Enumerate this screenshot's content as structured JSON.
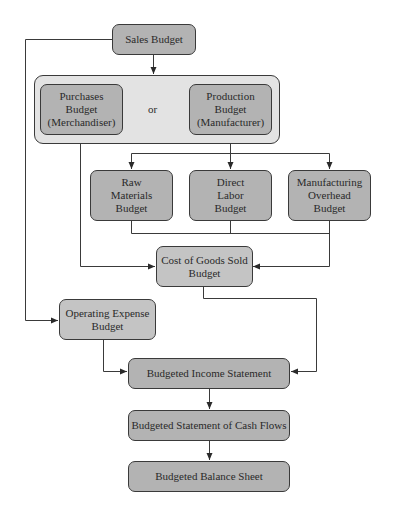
{
  "diagram": {
    "colors": {
      "group_fill": "#e3e3e3",
      "box_dark": "#b3b3b3",
      "box_mid": "#c4c4c4",
      "line": "#3a3a3a"
    },
    "nodes": {
      "sales": "Sales Budget",
      "purchases": "Purchases\nBudget\n(Merchandiser)",
      "or": "or",
      "production": "Production\nBudget\n(Manufacturer)",
      "raw_materials": "Raw\nMaterials\nBudget",
      "direct_labor": "Direct\nLabor\nBudget",
      "overhead": "Manufacturing\nOverhead\nBudget",
      "cogs": "Cost of Goods Sold\nBudget",
      "operating_expense": "Operating Expense\nBudget",
      "income_statement": "Budgeted Income Statement",
      "cash_flows": "Budgeted Statement of Cash Flows",
      "balance_sheet": "Budgeted Balance Sheet"
    },
    "edges": [
      [
        "sales",
        "purchases_or_production"
      ],
      [
        "sales",
        "operating_expense"
      ],
      [
        "production",
        "raw_materials"
      ],
      [
        "production",
        "direct_labor"
      ],
      [
        "production",
        "overhead"
      ],
      [
        "purchases",
        "cogs"
      ],
      [
        "raw_materials",
        "cogs"
      ],
      [
        "direct_labor",
        "cogs"
      ],
      [
        "overhead",
        "cogs"
      ],
      [
        "operating_expense",
        "income_statement"
      ],
      [
        "cogs",
        "income_statement"
      ],
      [
        "income_statement",
        "cash_flows"
      ],
      [
        "cash_flows",
        "balance_sheet"
      ]
    ]
  }
}
